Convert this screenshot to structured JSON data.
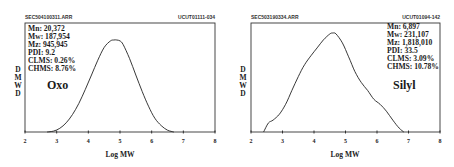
{
  "chart_data": [
    {
      "type": "line",
      "header_left": "SEC504100311.ARR",
      "header_right": "UCUT01111-034",
      "title": "Oxo",
      "xlabel": "Log MW",
      "ylabel": "DMWD",
      "xlim": [
        2,
        8
      ],
      "xticks": [
        "2",
        "3",
        "4",
        "5",
        "6",
        "7",
        "8"
      ],
      "grid": false,
      "stats": [
        "Mn: 20,372",
        "Mw: 187,954",
        "Mz: 945,945",
        "PDI: 9.2",
        "CLMS: 0.26%",
        "CHMS: 8.76%"
      ],
      "series": [
        {
          "name": "Oxo",
          "x": [
            2.7,
            2.9,
            3.1,
            3.3,
            3.5,
            3.7,
            3.9,
            4.1,
            4.3,
            4.5,
            4.7,
            4.8,
            4.9,
            5.0,
            5.1,
            5.3,
            5.5,
            5.7,
            5.9,
            6.1,
            6.3,
            6.5,
            6.7
          ],
          "y": [
            0.0,
            0.01,
            0.04,
            0.1,
            0.19,
            0.31,
            0.46,
            0.62,
            0.78,
            0.92,
            0.99,
            1.0,
            1.0,
            0.99,
            0.95,
            0.8,
            0.62,
            0.44,
            0.28,
            0.15,
            0.07,
            0.02,
            0.0
          ]
        }
      ]
    },
    {
      "type": "line",
      "header_left": "SEC503190334.ARR",
      "header_right": "UCUT01094-142",
      "title": "Silyl",
      "xlabel": "Log MW",
      "ylabel": "DMWD",
      "xlim": [
        2,
        8
      ],
      "xticks": [
        "2",
        "3",
        "4",
        "5",
        "6",
        "7",
        "8"
      ],
      "grid": false,
      "stats": [
        "Mn: 6,897",
        "Mw: 231,107",
        "Mz: 1,818,010",
        "PDI: 33.5",
        "CLMS: 3.09%",
        "CHMS: 10.78%"
      ],
      "series": [
        {
          "name": "Silyl",
          "x": [
            2.4,
            2.55,
            2.7,
            2.9,
            3.1,
            3.3,
            3.5,
            3.7,
            3.9,
            4.1,
            4.3,
            4.5,
            4.6,
            4.7,
            4.9,
            5.1,
            5.3,
            5.5,
            5.7,
            5.9,
            6.1,
            6.3,
            6.5,
            6.7,
            6.85
          ],
          "y": [
            0.0,
            0.09,
            0.12,
            0.18,
            0.28,
            0.42,
            0.56,
            0.68,
            0.77,
            0.85,
            0.93,
            0.99,
            1.0,
            0.99,
            0.9,
            0.76,
            0.61,
            0.5,
            0.42,
            0.33,
            0.28,
            0.21,
            0.12,
            0.04,
            0.0
          ]
        }
      ]
    }
  ]
}
